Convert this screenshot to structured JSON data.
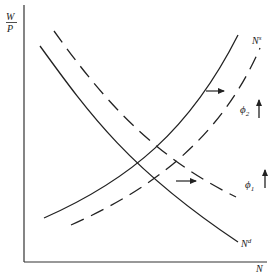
{
  "diagram": {
    "axes": {
      "y_label_num": "W",
      "y_label_den": "P",
      "x_label": "N"
    },
    "curves": [
      {
        "name": "labor-demand-initial",
        "label": "N",
        "label_sup": "d",
        "style": "solid"
      },
      {
        "name": "labor-demand-shifted",
        "style": "dashed"
      },
      {
        "name": "labor-supply-initial",
        "label": "N",
        "label_sup": "s",
        "style": "solid"
      },
      {
        "name": "labor-supply-shifted",
        "style": "dashed"
      }
    ],
    "annotations": {
      "phi2": "ϕ",
      "phi2_sub": "2",
      "phi1": "ϕ",
      "phi1_sub": "1"
    },
    "colors": {
      "line": "#222222",
      "background": "#ffffff"
    }
  }
}
